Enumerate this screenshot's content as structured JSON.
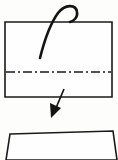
{
  "diagram": {
    "type": "origami-fold-instruction",
    "background_color": "#fdfdfc",
    "line_color": "#1a1a1a",
    "paper_fill": "#fefefe",
    "steps": [
      {
        "id": "step-upper",
        "label": "Unfolded sheet with horizontal valley fold line",
        "shape": "rectangle",
        "shape_points": "5,22 112,22 112,97 5,97",
        "fold_line": {
          "style": "dash-dot",
          "orientation": "horizontal",
          "y": 72,
          "x_start": 6,
          "x_end": 111,
          "dash_pattern": "9 3 2 3"
        },
        "hook_arrow": {
          "label": "fold-over hook arrow",
          "path": "M 40,58 C 44,42 50,24 58,13 C 65,4 76,4 77,12 C 78,17 74,21 70,22"
        }
      },
      {
        "id": "step-lower",
        "label": "Resulting folded sheet",
        "shape": "quadrilateral",
        "shape_points": "10,134 113,131 117,160 6,160"
      }
    ],
    "transition_arrow": {
      "label": "proceed to next step arrow",
      "shaft": "M 64,89 L 56,108",
      "head_points": "51,118 50,103 61,108"
    }
  }
}
